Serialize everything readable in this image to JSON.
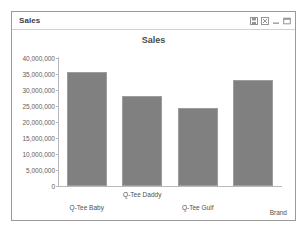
{
  "window": {
    "title": "Sales",
    "controls": [
      {
        "name": "save-icon",
        "glyph": "save"
      },
      {
        "name": "excel-icon",
        "glyph": "excel"
      },
      {
        "name": "minimize-icon",
        "glyph": "minimize"
      },
      {
        "name": "maximize-icon",
        "glyph": "maximize"
      }
    ]
  },
  "colors": {
    "bar_fill": "#808080",
    "bar_border": "#9d9d9d",
    "axis": "#b9b9b9",
    "text": "#4f4f4f",
    "panel_border": "#9a9a9a"
  },
  "chart_data": {
    "type": "bar",
    "title": "Sales",
    "xlabel": "Brand",
    "ylabel": "",
    "categories": [
      "Q-Tee Baby",
      "Q-Tee Daddy",
      "Q-Tee Gulf",
      "Brand"
    ],
    "values": [
      35500000,
      28000000,
      24500000,
      33000000
    ],
    "ylim": [
      0,
      40000000
    ],
    "yticks": [
      0,
      5000000,
      10000000,
      15000000,
      20000000,
      25000000,
      30000000,
      35000000,
      40000000
    ],
    "ytick_labels": [
      "0",
      "5,000,000",
      "10,000,000",
      "15,000,000",
      "20,000,000",
      "25,000,000",
      "30,000,000",
      "35,000,000",
      "40,000,000"
    ],
    "grid": false,
    "legend": false
  }
}
